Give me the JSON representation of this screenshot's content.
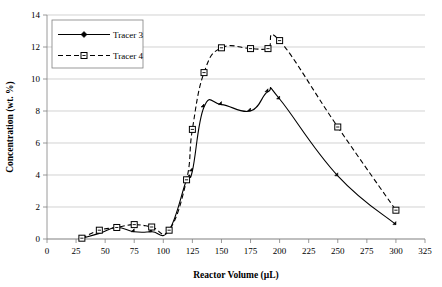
{
  "chart_data": {
    "type": "line",
    "title": "",
    "xlabel": "Reactor Volume (µL)",
    "ylabel": "Concentration (wt. %)",
    "xlim": [
      0,
      325
    ],
    "ylim": [
      0,
      14
    ],
    "xticks": [
      0,
      25,
      50,
      75,
      100,
      125,
      150,
      175,
      200,
      225,
      250,
      275,
      300,
      325
    ],
    "yticks": [
      0,
      2,
      4,
      6,
      8,
      10,
      12,
      14
    ],
    "xtick_labels": [
      "0",
      "25",
      "50",
      "75",
      "100",
      "125",
      "150",
      "175",
      "200",
      "225",
      "250",
      "275",
      "300",
      "325"
    ],
    "ytick_labels": [
      "0",
      "2",
      "4",
      "6",
      "8",
      "10",
      "12",
      "14"
    ],
    "grid": "horizontal",
    "legend_position": "top-left",
    "series": [
      {
        "name": "Tracer 3",
        "line_style": "solid",
        "marker": "filled-diamond",
        "color": "#000000",
        "x": [
          30,
          45,
          60,
          75,
          90,
          105,
          120,
          125,
          135,
          150,
          175,
          190,
          200,
          250,
          300
        ],
        "values": [
          0.05,
          0.35,
          0.72,
          0.45,
          0.45,
          0.55,
          3.7,
          4.25,
          8.25,
          8.4,
          8.0,
          9.2,
          8.75,
          3.95,
          0.9
        ]
      },
      {
        "name": "Tracer 4",
        "line_style": "dashed",
        "marker": "open-square",
        "color": "#000000",
        "x": [
          30,
          45,
          60,
          75,
          90,
          105,
          120,
          125,
          135,
          150,
          175,
          190,
          200,
          250,
          300
        ],
        "values": [
          0.05,
          0.55,
          0.72,
          0.9,
          0.75,
          0.55,
          3.7,
          6.85,
          10.4,
          11.95,
          11.9,
          11.9,
          12.4,
          7.0,
          1.8
        ]
      }
    ]
  },
  "legend": {
    "entries": [
      {
        "label": "Tracer 3"
      },
      {
        "label": "Tracer 4"
      }
    ]
  }
}
